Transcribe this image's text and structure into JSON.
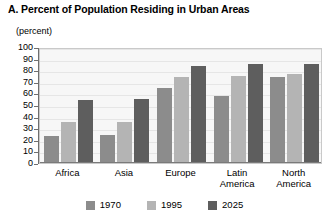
{
  "chart_data": {
    "type": "bar",
    "title": "A. Percent of Population Residing in Urban Areas",
    "subtitle": "(percent)",
    "xlabel": "",
    "ylabel": "(percent)",
    "ylim": [
      0,
      100
    ],
    "ytick_labels": [
      "100",
      "90",
      "80",
      "70",
      "60",
      "50",
      "40",
      "30",
      "20",
      "10",
      "0"
    ],
    "ytick_values": [
      100,
      90,
      80,
      70,
      60,
      50,
      40,
      30,
      20,
      10,
      0
    ],
    "grid": true,
    "legend_position": "bottom",
    "categories": [
      "Africa",
      "Asia",
      "Europe",
      "Latin America",
      "North America"
    ],
    "category_label_lines": [
      [
        "Africa"
      ],
      [
        "Asia"
      ],
      [
        "Europe"
      ],
      [
        "Latin",
        "America"
      ],
      [
        "North",
        "America"
      ]
    ],
    "series": [
      {
        "name": "1970",
        "color": "#8c8c8c",
        "values": [
          23,
          24,
          65,
          58,
          74
        ]
      },
      {
        "name": "1995",
        "color": "#b4b4b4",
        "values": [
          35,
          35,
          74,
          75,
          77
        ]
      },
      {
        "name": "2025",
        "color": "#5e5e5e",
        "values": [
          54,
          55,
          84,
          85,
          85
        ]
      }
    ]
  },
  "legend": {
    "items": [
      {
        "label": "1970",
        "color": "#8c8c8c"
      },
      {
        "label": "1995",
        "color": "#b4b4b4"
      },
      {
        "label": "2025",
        "color": "#5e5e5e"
      }
    ]
  },
  "colors": {
    "series_1970": "#8c8c8c",
    "series_1995": "#b4b4b4",
    "series_2025": "#5e5e5e",
    "plot_background": "#f7f7f7",
    "plot_border": "#c9c9c9",
    "gridline": "#e6e6e6",
    "axis": "#6f6f6f",
    "text": "#000000",
    "page_background": "#ffffff"
  }
}
